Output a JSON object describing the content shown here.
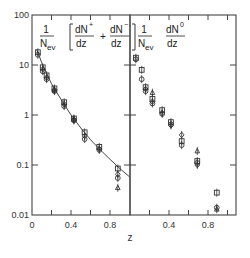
{
  "chart_data": {
    "type": "scatter",
    "xlabel": "z",
    "yscale": "log",
    "ylim": [
      0.01,
      100
    ],
    "y_ticks": [
      {
        "value": 100,
        "label": "100"
      },
      {
        "value": 10,
        "label": "10"
      },
      {
        "value": 1,
        "label": "1"
      },
      {
        "value": 0.1,
        "label": "0.1"
      },
      {
        "value": 0.01,
        "label": "0.01"
      }
    ],
    "panels": [
      {
        "name": "charged",
        "title_prefix": "1",
        "title_den": "N",
        "title_den_sub": "ev",
        "title_terms": [
          {
            "num": "dN",
            "sup": "+",
            "den": "dz"
          },
          {
            "num": "dN",
            "sup": "−",
            "den": "dz"
          }
        ],
        "title_op": "+",
        "xlim": [
          0,
          1.0
        ],
        "x_ticks": [
          {
            "value": 0,
            "label": "0"
          },
          {
            "value": 0.4,
            "label": "0.4"
          },
          {
            "value": 0.8,
            "label": "0.8"
          }
        ],
        "x_minor_ticks": [
          0.2,
          0.6
        ],
        "curve": {
          "x": [
            0.05,
            0.1,
            0.2,
            0.3,
            0.4,
            0.5,
            0.6,
            0.7,
            0.8,
            0.9,
            1.0
          ],
          "y": [
            20,
            11,
            4.2,
            2.0,
            1.0,
            0.55,
            0.32,
            0.2,
            0.13,
            0.085,
            0.058
          ]
        },
        "series": [
          {
            "marker": "circle",
            "points": [
              [
                0.06,
                16
              ],
              [
                0.11,
                7.5
              ],
              [
                0.15,
                5.2
              ],
              [
                0.23,
                3.0
              ],
              [
                0.33,
                1.5
              ],
              [
                0.43,
                0.78
              ],
              [
                0.54,
                0.33
              ],
              [
                0.69,
                0.2
              ],
              [
                0.88,
                0.055
              ]
            ]
          },
          {
            "marker": "square",
            "points": [
              [
                0.06,
                18
              ],
              [
                0.11,
                9
              ],
              [
                0.15,
                6.2
              ],
              [
                0.23,
                3.4
              ],
              [
                0.33,
                1.8
              ],
              [
                0.43,
                0.85
              ],
              [
                0.54,
                0.45
              ],
              [
                0.69,
                0.23
              ],
              [
                0.88,
                0.085
              ]
            ]
          },
          {
            "marker": "diamond",
            "points": [
              [
                0.11,
                8.2
              ],
              [
                0.15,
                5.6
              ],
              [
                0.23,
                3.2
              ],
              [
                0.33,
                1.65
              ],
              [
                0.43,
                0.8
              ],
              [
                0.54,
                0.38
              ],
              [
                0.69,
                0.21
              ],
              [
                0.88,
                0.065
              ]
            ]
          },
          {
            "marker": "triangle",
            "points": [
              [
                0.23,
                3.1
              ],
              [
                0.43,
                0.82
              ],
              [
                0.88,
                0.035
              ]
            ]
          }
        ]
      },
      {
        "name": "neutral",
        "title_prefix": "1",
        "title_den": "N",
        "title_den_sub": "ev",
        "title_terms": [
          {
            "num": "dN",
            "sup": "0",
            "den": "dz"
          }
        ],
        "title_op": "",
        "xlim": [
          0,
          1.1
        ],
        "x_ticks": [
          {
            "value": 0.4,
            "label": "0.4"
          },
          {
            "value": 0.8,
            "label": "0.8"
          }
        ],
        "x_minor_ticks": [
          0.2,
          0.6,
          1.0
        ],
        "series": [
          {
            "marker": "circle",
            "points": [
              [
                0.06,
                13
              ],
              [
                0.12,
                5.2
              ],
              [
                0.16,
                3.0
              ],
              [
                0.23,
                1.7
              ],
              [
                0.33,
                1.05
              ],
              [
                0.42,
                0.65
              ],
              [
                0.53,
                0.25
              ],
              [
                0.69,
                0.11
              ],
              [
                0.89,
                0.014
              ]
            ]
          },
          {
            "marker": "square",
            "points": [
              [
                0.06,
                14
              ],
              [
                0.12,
                8
              ],
              [
                0.16,
                3.6
              ],
              [
                0.23,
                2.1
              ],
              [
                0.33,
                1.25
              ],
              [
                0.42,
                0.72
              ],
              [
                0.53,
                0.3
              ],
              [
                0.69,
                0.12
              ],
              [
                0.89,
                0.028
              ]
            ]
          },
          {
            "marker": "diamond",
            "points": [
              [
                0.16,
                3.3
              ],
              [
                0.23,
                1.85
              ],
              [
                0.33,
                1.1
              ],
              [
                0.42,
                0.62
              ],
              [
                0.53,
                0.4
              ],
              [
                0.69,
                0.1
              ]
            ]
          },
          {
            "marker": "triangle",
            "points": [
              [
                0.23,
                2.8
              ],
              [
                0.69,
                0.19
              ],
              [
                0.89,
                0.013
              ]
            ]
          }
        ]
      }
    ]
  }
}
